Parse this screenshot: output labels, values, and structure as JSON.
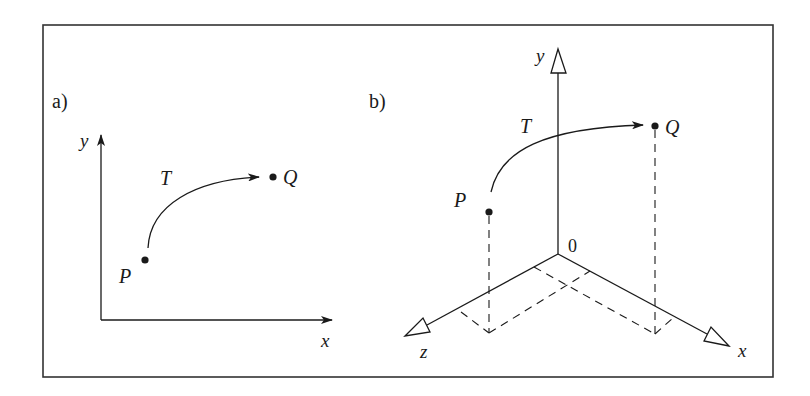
{
  "figure": {
    "frame_color": "#333333",
    "ink_color": "#1a1a1a",
    "panel_a": {
      "label": "a)",
      "axes": {
        "x_label": "x",
        "y_label": "y"
      },
      "points": [
        {
          "name": "P",
          "label": "P"
        },
        {
          "name": "Q",
          "label": "Q"
        }
      ],
      "transform_label": "T"
    },
    "panel_b": {
      "label": "b)",
      "axes": {
        "x_label": "x",
        "y_label": "y",
        "z_label": "z",
        "origin_label": "0"
      },
      "points": [
        {
          "name": "P",
          "label": "P"
        },
        {
          "name": "Q",
          "label": "Q"
        }
      ],
      "transform_label": "T"
    }
  }
}
